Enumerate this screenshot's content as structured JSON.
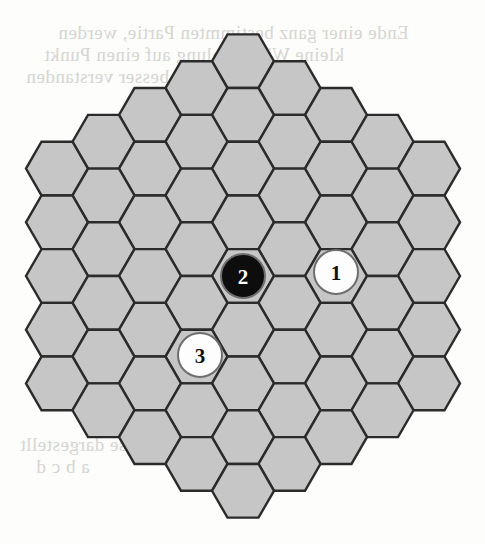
{
  "board": {
    "title": "Hexagonal game board",
    "shape": "hexagon",
    "radius": 4,
    "cell_count": 61,
    "orientation": "flat-top",
    "geometry": {
      "center_x": 243,
      "center_y": 276,
      "hex_radius": 31,
      "col_spacing": 46.5,
      "row_spacing": 53.7
    },
    "colors": {
      "cell_fill": "#c6c6c6",
      "cell_stroke": "#2b2b2b",
      "page_background": "#fdfdfc",
      "black_piece_fill": "#0d0d0d",
      "black_piece_label": "#ffffff",
      "white_piece_fill": "#fdfdfd",
      "white_piece_label": "#111111",
      "piece_stroke": "#6e6e6e",
      "bleed_text": "#cfcfcb"
    }
  },
  "pieces": [
    {
      "label": "1",
      "color": "white",
      "q": 1,
      "r": -1,
      "cx": 336,
      "cy": 272,
      "radius": 22
    },
    {
      "label": "2",
      "color": "black",
      "q": 0,
      "r": 0,
      "cx": 243,
      "cy": 276,
      "radius": 22
    },
    {
      "label": "3",
      "color": "white",
      "q": -1,
      "r": 1,
      "cx": 200,
      "cy": 355,
      "radius": 22
    }
  ],
  "bleed_text": {
    "line1": "Ende einer ganz bestimmten Partie, werden",
    "line2": "kleine Wiederholung auf einen Punkt",
    "line3": "besser verstanden",
    "line4": "Vorgang ist in dieser Weise dargestellt",
    "line5": "a b c d",
    "line6": "die Stellung",
    "line7": "Zug"
  }
}
